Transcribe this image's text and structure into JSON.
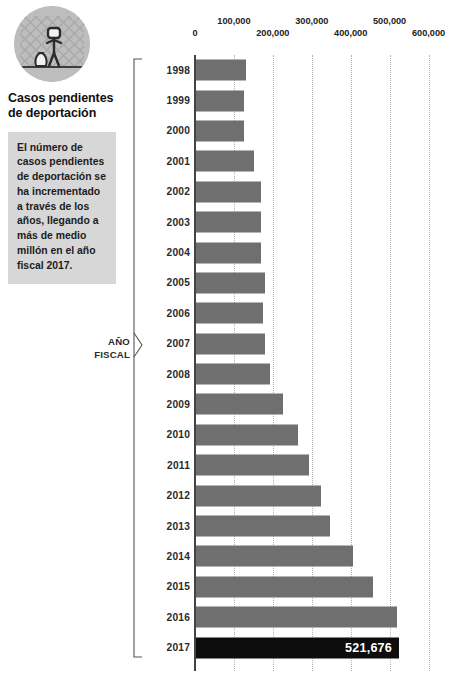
{
  "header": {
    "icon_name": "deportation-fence-person-icon",
    "title": "Casos pendientes de deportación"
  },
  "info_box": {
    "text": "El número de casos pendientes de deportación se ha incrementado a través de los años, llegando a más de medio millón en el año fiscal 2017."
  },
  "axis_group_label": {
    "line1": "AÑO",
    "line2": "FISCAL"
  },
  "colors": {
    "bar": "#6f6f6f",
    "bar_highlight": "#0d0d0d",
    "info_box_bg": "#d7d7d7",
    "icon_bg": "#bdbdbd",
    "gridline": "#b4b4b4",
    "axis": "#444444",
    "value_label": "#ffffff"
  },
  "chart_data": {
    "type": "bar",
    "orientation": "horizontal",
    "title": "Casos pendientes de deportación",
    "xlabel": "",
    "ylabel": "AÑO FISCAL",
    "xlim": [
      0,
      650000
    ],
    "grid": true,
    "legend": "none",
    "tick_labels": [
      "0",
      "100,000",
      "200,000",
      "300,000",
      "400,000",
      "500,000",
      "600,000"
    ],
    "tick_values": [
      0,
      100000,
      200000,
      300000,
      400000,
      500000,
      600000
    ],
    "categories": [
      "1998",
      "1999",
      "2000",
      "2001",
      "2002",
      "2003",
      "2004",
      "2005",
      "2006",
      "2007",
      "2008",
      "2009",
      "2010",
      "2011",
      "2012",
      "2013",
      "2014",
      "2015",
      "2016",
      "2017"
    ],
    "values": [
      129000,
      123000,
      123000,
      150000,
      168000,
      168000,
      167000,
      177000,
      172000,
      177000,
      189000,
      224000,
      261000,
      291000,
      322000,
      344000,
      404000,
      455000,
      517000,
      521676
    ],
    "highlight_category": "2017",
    "data_labels": {
      "2017": "521,676"
    }
  }
}
